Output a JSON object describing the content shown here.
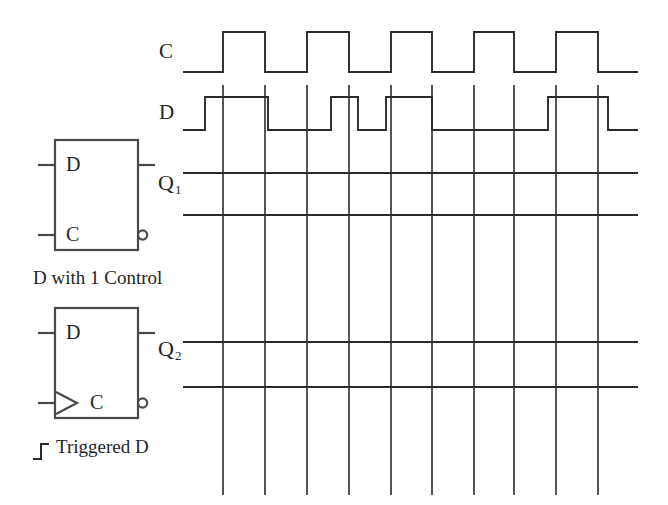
{
  "diagram": {
    "ink_color": "#2b2b2b",
    "background": "#ffffff"
  },
  "waveforms": {
    "clock": {
      "name": "C",
      "label": "C",
      "type": "square-wave",
      "pulse_count": 5,
      "high_y": 32,
      "low_y": 72,
      "start_x": 183,
      "end_x": 638,
      "transitions_x": [
        223,
        265,
        307,
        349,
        391,
        432,
        474,
        514,
        556,
        598
      ],
      "description": "Periodic clock, starts low, five high pulses, ends low"
    },
    "data": {
      "name": "D",
      "label": "D",
      "type": "square-wave",
      "high_y": 97,
      "low_y": 130,
      "start_x": 183,
      "end_x": 638,
      "transitions_x": [
        205,
        268,
        331,
        358,
        386,
        432,
        548,
        608
      ],
      "description": "Data input, starts low, irregular pulse pattern"
    },
    "q1": {
      "name": "Q1",
      "label": "Q",
      "subscript": "1",
      "type": "blank-reference-lines",
      "high_y": 173,
      "low_y": 215,
      "start_x": 183,
      "end_x": 638,
      "description": "Blank output track for the D latch with 1 control"
    },
    "q2": {
      "name": "Q2",
      "label": "Q",
      "subscript": "2",
      "type": "blank-reference-lines",
      "high_y": 342,
      "low_y": 387,
      "start_x": 183,
      "end_x": 638,
      "description": "Blank output track for the edge triggered D flip-flop"
    }
  },
  "grid": {
    "vertical_lines_x": [
      223,
      265,
      307,
      349,
      391,
      432,
      474,
      514,
      556,
      598
    ],
    "top_y": 85,
    "bottom_y": 495,
    "count": 10
  },
  "symbols": {
    "latch": {
      "name": "d-latch",
      "caption": "D with 1 Control",
      "box": {
        "x": 55,
        "y": 140,
        "width": 83,
        "height": 110
      },
      "inputs": [
        {
          "name": "D",
          "label": "D",
          "y": 165
        },
        {
          "name": "C",
          "label": "C",
          "y": 235
        }
      ],
      "outputs": [
        {
          "name": "Q",
          "label": "",
          "y": 165,
          "inverted": false
        },
        {
          "name": "Qbar",
          "label": "",
          "y": 235,
          "inverted": true
        }
      ],
      "edge_triggered": false
    },
    "flipflop": {
      "name": "edge-triggered-d",
      "caption": "Triggered D",
      "edge_glyph": "rising-edge-step",
      "box": {
        "x": 55,
        "y": 308,
        "width": 83,
        "height": 110
      },
      "inputs": [
        {
          "name": "D",
          "label": "D",
          "y": 333
        },
        {
          "name": "C",
          "label": "C",
          "y": 403
        }
      ],
      "outputs": [
        {
          "name": "Q",
          "label": "",
          "y": 333,
          "inverted": false
        },
        {
          "name": "Qbar",
          "label": "",
          "y": 403,
          "inverted": true
        }
      ],
      "edge_triggered": true
    }
  },
  "chart_data": {
    "type": "line",
    "xlabel": "",
    "ylabel": "",
    "grid": true,
    "legend": "none",
    "series": [
      {
        "name": "C",
        "levels": [
          0,
          1,
          0,
          1,
          0,
          1,
          0,
          1,
          0,
          1,
          0
        ],
        "edges_x": [
          223,
          265,
          307,
          349,
          391,
          432,
          474,
          514,
          556,
          598
        ]
      },
      {
        "name": "D",
        "levels": [
          0,
          1,
          0,
          1,
          0,
          1,
          0,
          1,
          0
        ],
        "edges_x": [
          205,
          268,
          331,
          358,
          386,
          432,
          548,
          608
        ]
      },
      {
        "name": "Q1",
        "levels": [],
        "edges_x": []
      },
      {
        "name": "Q2",
        "levels": [],
        "edges_x": []
      }
    ]
  }
}
